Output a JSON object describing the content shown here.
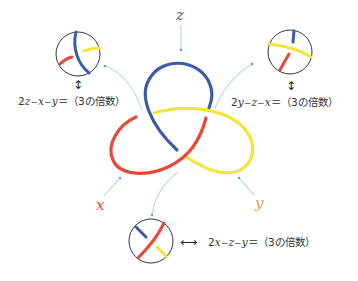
{
  "colors": {
    "x": "#e8473a",
    "y": "#f2e53c",
    "z": "#3d5aa6",
    "leader": "#b9dcea",
    "leader_dot": "#5aa9cf",
    "circle": "#333333",
    "x_label": "#e8473a",
    "y_label": "#e89a4a",
    "z_label": "#4b5a9a"
  },
  "variables": {
    "x": {
      "label": "x"
    },
    "y": {
      "label": "y"
    },
    "z": {
      "label": "z"
    }
  },
  "crossings": [
    {
      "id": "top-left",
      "arrow": "vertical",
      "equation": {
        "coef": "2",
        "terms": [
          "z",
          "x",
          "y"
        ],
        "ops": [
          "−",
          "−"
        ],
        "rhs": "＝（3の倍数）"
      }
    },
    {
      "id": "top-right",
      "arrow": "vertical",
      "equation": {
        "coef": "2",
        "terms": [
          "y",
          "z",
          "x"
        ],
        "ops": [
          "−",
          "−"
        ],
        "rhs": "＝（3の倍数）"
      }
    },
    {
      "id": "bottom",
      "arrow": "horizontal",
      "equation": {
        "coef": "2",
        "terms": [
          "x",
          "z",
          "y"
        ],
        "ops": [
          "−",
          "−"
        ],
        "rhs": "＝（3の倍数）"
      }
    }
  ],
  "glyphs": {
    "arrow_vertical": "↕",
    "arrow_horizontal": "⟷"
  }
}
